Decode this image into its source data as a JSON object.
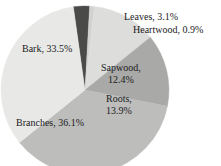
{
  "figure": {
    "title_clipped": "of tree biomass",
    "background_color": "#ffffff"
  },
  "chart_data": {
    "type": "pie",
    "title": "of tree biomass",
    "xlabel": "",
    "ylabel": "",
    "legend_position": "none",
    "labels_inline": true,
    "total_percent": 99.9,
    "start_angle_deg": 352,
    "direction": "clockwise",
    "categories": [
      "Leaves",
      "Heartwood",
      "Sapwood",
      "Roots",
      "Branches",
      "Bark"
    ],
    "values": [
      3.1,
      0.9,
      12.4,
      13.9,
      36.1,
      33.5
    ],
    "colors": [
      "#4a4a48",
      "#d2d2d0",
      "#dddddb",
      "#a9a9a7",
      "#bdbdbb",
      "#e8e8e6"
    ],
    "slices": [
      {
        "name": "Leaves",
        "value": 3.1,
        "label": "Leaves, 3.1%",
        "color": "#4a4a48"
      },
      {
        "name": "Heartwood",
        "value": 0.9,
        "label": "Heartwood, 0.9%",
        "color": "#d2d2d0"
      },
      {
        "name": "Sapwood",
        "value": 12.4,
        "label_line1": "Sapwood,",
        "label_line2": "12.4%",
        "color": "#dddddb"
      },
      {
        "name": "Roots",
        "value": 13.9,
        "label_line1": "Roots,",
        "label_line2": "13.9%",
        "color": "#a9a9a7"
      },
      {
        "name": "Branches",
        "value": 36.1,
        "label": "Branches, 36.1%",
        "color": "#bdbdbb"
      },
      {
        "name": "Bark",
        "value": 33.5,
        "label": "Bark, 33.5%",
        "color": "#e8e8e6"
      }
    ]
  },
  "labels": {
    "leaves": "Leaves, 3.1%",
    "heartwood": "Heartwood, 0.9%",
    "bark": "Bark, 33.5%",
    "sapwood_line1": "Sapwood,",
    "sapwood_line2": "12.4%",
    "roots_line1": "Roots,",
    "roots_line2": "13.9%",
    "branches": "Branches, 36.1%"
  }
}
